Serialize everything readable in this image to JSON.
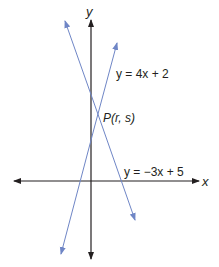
{
  "diagram": {
    "axes": {
      "x_label": "x",
      "y_label": "y"
    },
    "lines": [
      {
        "equation": "y = 4x + 2",
        "color": "#6f86c6"
      },
      {
        "equation": "y = −3x + 5",
        "color": "#6f86c6"
      }
    ],
    "intersection_label": "P(r, s)",
    "colors": {
      "axis": "#231f20",
      "line": "#6f86c6"
    }
  }
}
